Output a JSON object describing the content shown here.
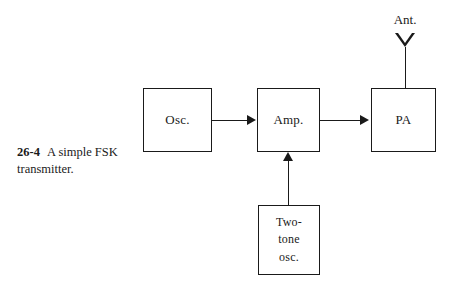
{
  "figure": {
    "number": "26-4",
    "caption": "A simple FSK transmitter.",
    "width": 452,
    "height": 285,
    "background_color": "#ffffff",
    "line_color": "#1a1a1a"
  },
  "diagram": {
    "type": "block-diagram",
    "blocks": [
      {
        "id": "osc",
        "label": "Osc.",
        "x": 143,
        "y": 88,
        "w": 69,
        "h": 64
      },
      {
        "id": "amp",
        "label": "Amp.",
        "x": 257,
        "y": 88,
        "w": 63,
        "h": 64
      },
      {
        "id": "pa",
        "label": "PA",
        "x": 371,
        "y": 88,
        "w": 65,
        "h": 64
      },
      {
        "id": "twotone",
        "label": "Two-\ntone\nosc.",
        "x": 258,
        "y": 205,
        "w": 62,
        "h": 70
      }
    ],
    "connections": [
      {
        "id": "osc-amp",
        "from": "osc",
        "to": "amp",
        "direction": "right"
      },
      {
        "id": "amp-pa",
        "from": "amp",
        "to": "pa",
        "direction": "right"
      },
      {
        "id": "twotone-amp",
        "from": "twotone",
        "to": "amp",
        "direction": "up"
      },
      {
        "id": "pa-antenna",
        "from": "pa",
        "to": "antenna",
        "direction": "up"
      }
    ],
    "antenna": {
      "label": "Ant.",
      "icon": "antenna-triangle-icon"
    }
  }
}
